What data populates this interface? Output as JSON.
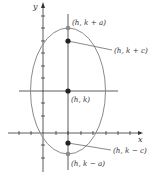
{
  "diagram": {
    "type": "vertical-ellipse",
    "axes": {
      "x_label": "x",
      "y_label": "y"
    },
    "colors": {
      "axis": "#333333",
      "ellipse": "#8a8a8a",
      "focus_point": "#222222",
      "vertex_point": "#8a8a8a",
      "leader": "#555555"
    },
    "points": {
      "vertex_top": {
        "label": "(h, k + a)"
      },
      "focus_top": {
        "label": "(h, k + c)"
      },
      "center": {
        "label": "(h, k)"
      },
      "focus_bottom": {
        "label": "(h, k − c)"
      },
      "vertex_bottom": {
        "label": "(h, k − a)"
      }
    }
  }
}
